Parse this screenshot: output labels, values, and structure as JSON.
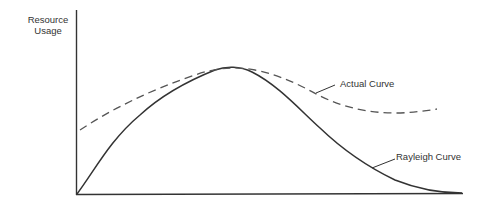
{
  "diagram": {
    "ylabel_line1": "Resource",
    "ylabel_line2": "Usage",
    "curves": [
      {
        "name": "Actual Curve",
        "style": "dashed",
        "color": "#555555"
      },
      {
        "name": "Rayleigh Curve",
        "style": "solid",
        "color": "#333333"
      }
    ],
    "labels": {
      "actual": "Actual Curve",
      "rayleigh": "Rayleigh Curve"
    },
    "axis_color": "#333333"
  }
}
